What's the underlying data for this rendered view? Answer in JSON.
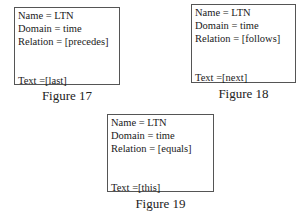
{
  "figures": [
    {
      "name_line": "Name = LTN",
      "domain_line": "Domain = time",
      "relation_line": "Relation = [precedes]",
      "text_line": "Text =[last]",
      "caption": "Figure 17"
    },
    {
      "name_line": "Name = LTN",
      "domain_line": "Domain = time",
      "relation_line": "Relation = [follows]",
      "text_line": "Text =[next]",
      "caption": "Figure 18"
    },
    {
      "name_line": "Name = LTN",
      "domain_line": "Domain = time",
      "relation_line": "Relation = [equals]",
      "text_line": "Text =[this]",
      "caption": "Figure 19"
    }
  ]
}
